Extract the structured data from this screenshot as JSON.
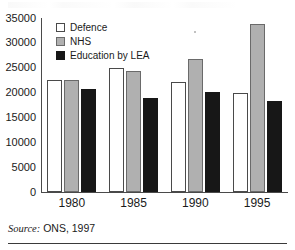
{
  "source_note": {
    "prefix": "Source:",
    "rest": " ONS, 1997"
  },
  "chart_data": {
    "type": "bar",
    "title": "",
    "subtitle": "",
    "xlabel": "",
    "ylabel": "",
    "categories": [
      "1980",
      "1985",
      "1990",
      "1995"
    ],
    "ylim": [
      0,
      35000
    ],
    "ytick_values": [
      35000,
      30000,
      25000,
      20000,
      15000,
      10000,
      5000,
      0
    ],
    "ytick_labels": [
      "35000",
      "30000",
      "25000",
      "20000",
      "15000",
      "10000",
      "5000",
      "0"
    ],
    "grid": false,
    "legend_position": "top-left-inside",
    "series": [
      {
        "name": "Defence",
        "color": "#ffffff",
        "edge_color": "#4a4a4a",
        "values": [
          22500,
          25000,
          22100,
          20000
        ]
      },
      {
        "name": "NHS",
        "color": "#b0b0b0",
        "edge_color": "#6a6a6a",
        "values": [
          22500,
          24400,
          26700,
          33800
        ]
      },
      {
        "name": "Education by LEA",
        "color": "#171717",
        "edge_color": "#171717",
        "values": [
          20800,
          18900,
          20100,
          18400
        ]
      }
    ]
  }
}
